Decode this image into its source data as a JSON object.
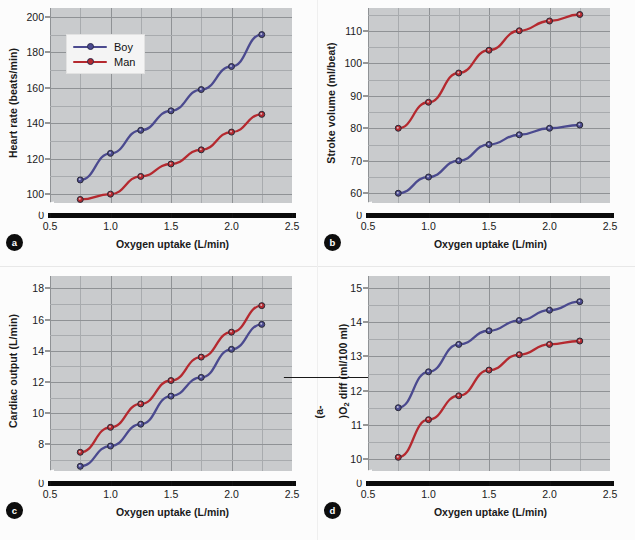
{
  "figure": {
    "shared_xlabel": "Oxygen uptake (L/min)",
    "legend": {
      "entries": [
        {
          "label": "Boy",
          "color": "#4b4a8f"
        },
        {
          "label": "Man",
          "color": "#b5292f"
        }
      ]
    },
    "colors": {
      "boy": "#4b4a8f",
      "man": "#b5292f",
      "plot_bg": "#c9cbcd",
      "grid": "#9a9da0",
      "axis": "#0b0b0b"
    }
  },
  "panels": [
    {
      "id": "a",
      "badge": "a",
      "ylabel_html": "Heart rate (beats/min)",
      "ylabel_plain": "Heart rate (beats/min)",
      "yticks": [
        "0",
        "100",
        "120",
        "140",
        "160",
        "180",
        "200"
      ],
      "xticks": [
        "0.5",
        "1.0",
        "1.5",
        "2.0",
        "2.5"
      ]
    },
    {
      "id": "b",
      "badge": "b",
      "ylabel_html": "Stroke volume (ml/beat)",
      "ylabel_plain": "Stroke volume (ml/beat)",
      "yticks": [
        "0",
        "60",
        "70",
        "80",
        "90",
        "100",
        "110"
      ],
      "xticks": [
        "0.5",
        "1.0",
        "1.5",
        "2.0",
        "2.5"
      ]
    },
    {
      "id": "c",
      "badge": "c",
      "ylabel_html": "Cardiac output (L/min)",
      "ylabel_plain": "Cardiac output (L/min)",
      "yticks": [
        "0",
        "8",
        "10",
        "12",
        "14",
        "16",
        "18"
      ],
      "xticks": [
        "0.5",
        "1.0",
        "1.5",
        "2.0",
        "2.5"
      ]
    },
    {
      "id": "d",
      "badge": "d",
      "ylabel_html": "(a-<span class=\"ovl\">v</span>)O<sub>2</sub> diff (ml/100 ml)",
      "ylabel_plain": "(a-v)O2 diff (ml/100 ml)",
      "yticks": [
        "0",
        "10",
        "11",
        "12",
        "13",
        "14",
        "15"
      ],
      "xticks": [
        "0.5",
        "1.0",
        "1.5",
        "2.0",
        "2.5"
      ]
    }
  ],
  "chart_data": [
    {
      "type": "line",
      "panel": "a",
      "title": "Heart rate vs oxygen uptake",
      "xlabel": "Oxygen uptake (L/min)",
      "ylabel": "Heart rate (beats/min)",
      "x": [
        0.75,
        1.0,
        1.25,
        1.5,
        1.75,
        2.0,
        2.25
      ],
      "xlim": [
        0.5,
        2.5
      ],
      "ylim": [
        95,
        205
      ],
      "ytick_values": [
        100,
        120,
        140,
        160,
        180,
        200
      ],
      "xtick_values": [
        0.5,
        1.0,
        1.5,
        2.0,
        2.5
      ],
      "axis_break": true,
      "grid": true,
      "legend_position": "upper-left",
      "series": [
        {
          "name": "Boy",
          "color": "#4b4a8f",
          "values": [
            108,
            123,
            136,
            147,
            159,
            172,
            190
          ]
        },
        {
          "name": "Man",
          "color": "#b5292f",
          "values": [
            97,
            100,
            110,
            117,
            125,
            135,
            145
          ]
        }
      ]
    },
    {
      "type": "line",
      "panel": "b",
      "title": "Stroke volume vs oxygen uptake",
      "xlabel": "Oxygen uptake (L/min)",
      "ylabel": "Stroke volume (ml/beat)",
      "x": [
        0.75,
        1.0,
        1.25,
        1.5,
        1.75,
        2.0,
        2.25
      ],
      "xlim": [
        0.5,
        2.5
      ],
      "ylim": [
        57,
        117
      ],
      "ytick_values": [
        60,
        70,
        80,
        90,
        100,
        110
      ],
      "xtick_values": [
        0.5,
        1.0,
        1.5,
        2.0,
        2.5
      ],
      "axis_break": true,
      "grid": true,
      "legend_position": "none",
      "series": [
        {
          "name": "Boy",
          "color": "#4b4a8f",
          "values": [
            60,
            65,
            70,
            75,
            78,
            80,
            81
          ]
        },
        {
          "name": "Man",
          "color": "#b5292f",
          "values": [
            80,
            88,
            97,
            104,
            110,
            113,
            115
          ]
        }
      ]
    },
    {
      "type": "line",
      "panel": "c",
      "title": "Cardiac output vs oxygen uptake",
      "xlabel": "Oxygen uptake (L/min)",
      "ylabel": "Cardiac output (L/min)",
      "x": [
        0.75,
        1.0,
        1.25,
        1.5,
        1.75,
        2.0,
        2.25
      ],
      "xlim": [
        0.5,
        2.5
      ],
      "ylim": [
        6.3,
        18.8
      ],
      "ytick_values": [
        8,
        10,
        12,
        14,
        16,
        18
      ],
      "xtick_values": [
        0.5,
        1.0,
        1.5,
        2.0,
        2.5
      ],
      "axis_break": true,
      "grid": true,
      "legend_position": "none",
      "series": [
        {
          "name": "Boy",
          "color": "#4b4a8f",
          "values": [
            6.6,
            7.9,
            9.3,
            11.1,
            12.3,
            14.1,
            15.7
          ]
        },
        {
          "name": "Man",
          "color": "#b5292f",
          "values": [
            7.5,
            9.1,
            10.6,
            12.1,
            13.6,
            15.2,
            16.9
          ]
        }
      ]
    },
    {
      "type": "line",
      "panel": "d",
      "title": "Arteriovenous oxygen difference vs oxygen uptake",
      "xlabel": "Oxygen uptake (L/min)",
      "ylabel": "(a-v)O2 diff (ml/100 ml)",
      "x": [
        0.75,
        1.0,
        1.25,
        1.5,
        1.75,
        2.0,
        2.25
      ],
      "xlim": [
        0.5,
        2.5
      ],
      "ylim": [
        9.65,
        15.35
      ],
      "ytick_values": [
        10,
        11,
        12,
        13,
        14,
        15
      ],
      "xtick_values": [
        0.5,
        1.0,
        1.5,
        2.0,
        2.5
      ],
      "axis_break": true,
      "grid": true,
      "legend_position": "none",
      "series": [
        {
          "name": "Boy",
          "color": "#4b4a8f",
          "values": [
            11.5,
            12.55,
            13.35,
            13.75,
            14.05,
            14.35,
            14.6
          ]
        },
        {
          "name": "Man",
          "color": "#b5292f",
          "values": [
            10.05,
            11.15,
            11.85,
            12.6,
            13.05,
            13.35,
            13.45
          ]
        }
      ]
    }
  ]
}
